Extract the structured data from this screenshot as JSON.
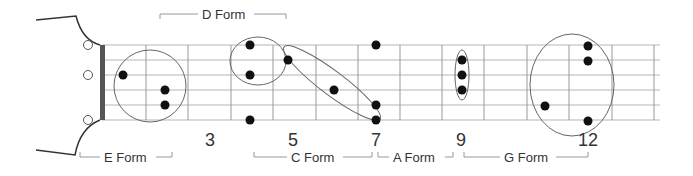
{
  "diagram": {
    "title": "",
    "colors": {
      "line": "#999999",
      "string": "#b5b5b5",
      "nut": "#555555",
      "dot": "#111111",
      "outline": "#666666",
      "text": "#333333"
    },
    "strings_y": [
      45,
      60,
      75,
      90,
      105,
      120
    ],
    "nut_x": 102,
    "frets_x": [
      146,
      188,
      231,
      273,
      316,
      358,
      400,
      442,
      484,
      527,
      569,
      612,
      654
    ],
    "fret_numbers": [
      {
        "label": "3",
        "x": 210
      },
      {
        "label": "5",
        "x": 293
      },
      {
        "label": "7",
        "x": 376
      },
      {
        "label": "9",
        "x": 461
      },
      {
        "label": "12",
        "x": 588
      }
    ],
    "forms": [
      {
        "name": "E Form",
        "label": "E Form",
        "position": "bottom",
        "x1": 80,
        "x2": 172,
        "text_x": 104
      },
      {
        "name": "D Form",
        "label": "D Form",
        "position": "top",
        "x1": 160,
        "x2": 286,
        "text_x": 202
      },
      {
        "name": "C Form",
        "label": "C Form",
        "position": "bottom",
        "x1": 254,
        "x2": 372,
        "text_x": 291
      },
      {
        "name": "A Form",
        "label": "A Form",
        "position": "bottom",
        "x1": 378,
        "x2": 453,
        "text_x": 393
      },
      {
        "name": "G Form",
        "label": "G Form",
        "position": "bottom",
        "x1": 464,
        "x2": 588,
        "text_x": 504
      }
    ],
    "dots": [
      {
        "x": 123,
        "y": 75
      },
      {
        "x": 165,
        "y": 90
      },
      {
        "x": 165,
        "y": 105
      },
      {
        "x": 250,
        "y": 45
      },
      {
        "x": 250,
        "y": 75
      },
      {
        "x": 288,
        "y": 60
      },
      {
        "x": 250,
        "y": 120
      },
      {
        "x": 334,
        "y": 90
      },
      {
        "x": 376,
        "y": 45
      },
      {
        "x": 376,
        "y": 105
      },
      {
        "x": 376,
        "y": 120
      },
      {
        "x": 462,
        "y": 60
      },
      {
        "x": 462,
        "y": 75
      },
      {
        "x": 462,
        "y": 90
      },
      {
        "x": 545,
        "y": 106
      },
      {
        "x": 588,
        "y": 46
      },
      {
        "x": 588,
        "y": 61
      },
      {
        "x": 588,
        "y": 121
      }
    ],
    "open_markers": [
      {
        "x": 88,
        "y": 45
      },
      {
        "x": 88,
        "y": 75
      },
      {
        "x": 88,
        "y": 120
      }
    ]
  }
}
